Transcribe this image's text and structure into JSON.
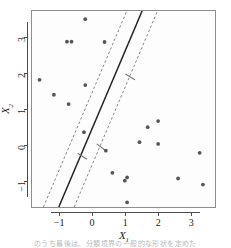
{
  "figure": {
    "caption_sliver": "のうち最後は、分類境界の一般的な形状を定めた"
  },
  "axes": {
    "x_title": "X",
    "x_title_sub": "1",
    "y_title": "X",
    "y_title_sub": "2",
    "x_ticks": [
      "-1",
      "0",
      "1",
      "2",
      "3"
    ],
    "y_ticks": [
      "-1",
      "0",
      "1",
      "2",
      "3"
    ]
  },
  "colors": {
    "point": "#555555",
    "boundary": "#222222",
    "margin": "#777777",
    "panel_background": "#fdfdfd",
    "frame": "#8e8e8e",
    "axis": "#4d4d4d"
  },
  "chart_data": {
    "type": "scatter",
    "title": "",
    "xlabel": "X1",
    "ylabel": "X2",
    "xlim": [
      -1.85,
      3.75
    ],
    "ylim": [
      -1.75,
      3.75
    ],
    "grid": false,
    "legend": "none",
    "points": [
      {
        "x": -0.22,
        "y": 3.52
      },
      {
        "x": -0.78,
        "y": 2.89
      },
      {
        "x": -0.64,
        "y": 2.89
      },
      {
        "x": 0.37,
        "y": 2.88
      },
      {
        "x": -1.62,
        "y": 1.82
      },
      {
        "x": -0.22,
        "y": 1.67
      },
      {
        "x": -1.18,
        "y": 1.4
      },
      {
        "x": -0.73,
        "y": 1.14
      },
      {
        "x": 1.69,
        "y": 0.49
      },
      {
        "x": 2.01,
        "y": 0.66
      },
      {
        "x": -0.26,
        "y": 0.35
      },
      {
        "x": 1.44,
        "y": 0.07
      },
      {
        "x": 2.01,
        "y": 0.02
      },
      {
        "x": 3.28,
        "y": -0.23
      },
      {
        "x": 0.41,
        "y": -0.17
      },
      {
        "x": 0.61,
        "y": -0.79
      },
      {
        "x": 1.06,
        "y": -0.92
      },
      {
        "x": 0.99,
        "y": -1.01
      },
      {
        "x": 2.62,
        "y": -0.95
      },
      {
        "x": 3.38,
        "y": -1.12
      },
      {
        "x": 1.06,
        "y": -1.62
      }
    ],
    "boundary_line": {
      "label": "separating hyperplane",
      "style": "solid",
      "x_at_y_lo": -1.03,
      "y_lo": -1.75,
      "x_at_y_hi": 1.52,
      "y_hi": 3.75
    },
    "margin_lines": [
      {
        "label": "lower margin",
        "style": "dashed",
        "x_at_y_lo": -0.56,
        "y_lo": -1.75,
        "x_at_y_hi": 1.99,
        "y_hi": 3.75
      },
      {
        "label": "upper margin",
        "style": "dashed",
        "x_at_y_lo": -1.5,
        "y_lo": -1.75,
        "x_at_y_hi": 1.05,
        "y_hi": 3.75
      }
    ],
    "margin_markers": [
      {
        "label": "margin-segment-upper",
        "x1": 1.01,
        "y1": 1.98,
        "x2": 1.3,
        "y2": 1.82
      },
      {
        "label": "margin-segment-middle",
        "x1": 0.13,
        "y1": 0.02,
        "x2": 0.41,
        "y2": -0.17
      },
      {
        "label": "margin-segment-lower",
        "x1": -0.45,
        "y1": -0.24,
        "x2": -0.17,
        "y2": -0.41
      }
    ]
  }
}
